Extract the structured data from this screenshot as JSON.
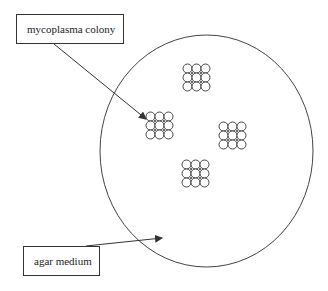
{
  "diagram": {
    "labels": {
      "colony": "mycoplasma colony",
      "medium": "agar medium"
    },
    "colors": {
      "stroke": "#333333",
      "background": "#ffffff"
    },
    "colonies": [
      {
        "name": "colony-top",
        "x": 183,
        "y": 64
      },
      {
        "name": "colony-left",
        "x": 146,
        "y": 112
      },
      {
        "name": "colony-right",
        "x": 219,
        "y": 122
      },
      {
        "name": "colony-bottom",
        "x": 182,
        "y": 160
      }
    ]
  }
}
